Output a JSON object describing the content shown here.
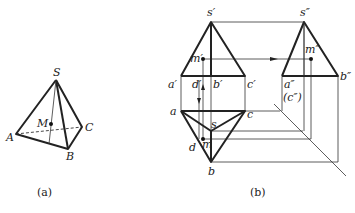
{
  "figure_a": {
    "caption": "(a)",
    "labels": {
      "S": "S",
      "M": "M",
      "A": "A",
      "B": "B",
      "C": "C"
    }
  },
  "figure_b": {
    "caption": "(b)",
    "front_view": {
      "s": "s′",
      "m": "m′",
      "a": "a′",
      "d": "d′",
      "b": "b′",
      "c": "c′"
    },
    "side_view": {
      "s": "s″",
      "m": "m″",
      "a": "a″",
      "c": "(c″)",
      "b": "b″"
    },
    "top_view": {
      "a": "a",
      "c": "c",
      "s": "s",
      "d": "d",
      "m": "m",
      "b": "b"
    }
  },
  "colors": {
    "line": "#222222",
    "background": "#ffffff"
  }
}
